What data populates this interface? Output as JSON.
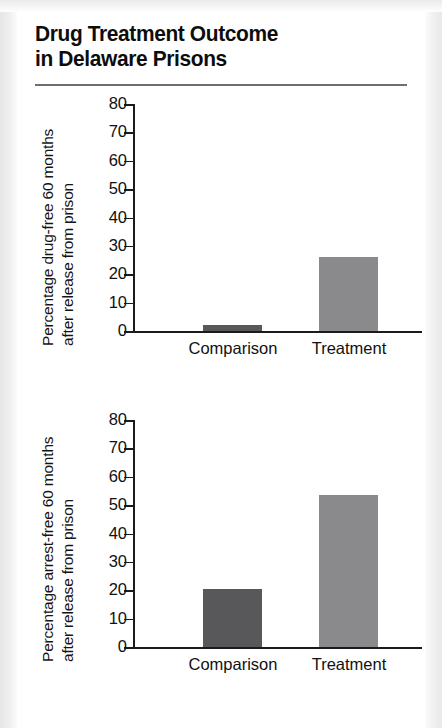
{
  "title": {
    "line1": "Drug Treatment Outcome",
    "line2": "in Delaware Prisons"
  },
  "colors": {
    "comparison_bar": "#58585a",
    "treatment_bar": "#8a8a8c",
    "axis": "#1b1b1b",
    "rule": "#6e6e6e",
    "page_background": "#ffffff"
  },
  "chart_data": [
    {
      "type": "bar",
      "title": "Drug Treatment Outcome in Delaware Prisons",
      "ylabel_line1": "Percentage drug-free 60 months",
      "ylabel_line2": "after release from prison",
      "ylabel": "Percentage drug-free 60 months after release from prison",
      "xlabel": "",
      "categories": [
        "Comparison",
        "Treatment"
      ],
      "values": [
        2,
        26
      ],
      "colors": [
        "#58585a",
        "#8a8a8c"
      ],
      "ylim": [
        0,
        80
      ],
      "yticks": [
        0,
        10,
        20,
        30,
        40,
        50,
        60,
        70,
        80
      ],
      "ytick_labels": [
        "0",
        "10",
        "20",
        "30",
        "40",
        "50",
        "60",
        "70",
        "80"
      ],
      "grid": false,
      "legend": false
    },
    {
      "type": "bar",
      "title": "Drug Treatment Outcome in Delaware Prisons",
      "ylabel_line1": "Percentage arrest-free 60 months",
      "ylabel_line2": "after release from prison",
      "ylabel": "Percentage arrest-free 60 months after release from prison",
      "xlabel": "",
      "categories": [
        "Comparison",
        "Treatment"
      ],
      "values": [
        20.5,
        53.5
      ],
      "colors": [
        "#58585a",
        "#8a8a8c"
      ],
      "ylim": [
        0,
        80
      ],
      "yticks": [
        0,
        10,
        20,
        30,
        40,
        50,
        60,
        70,
        80
      ],
      "ytick_labels": [
        "0",
        "10",
        "20",
        "30",
        "40",
        "50",
        "60",
        "70",
        "80"
      ],
      "grid": false,
      "legend": false
    }
  ]
}
